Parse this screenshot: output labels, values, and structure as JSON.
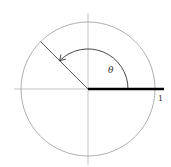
{
  "diagram": {
    "labels": {
      "theta": "θ",
      "radius_value": "1"
    },
    "geometry": {
      "center": [
        88,
        89
      ],
      "circle_radius": 67,
      "angle_degrees": 135,
      "arc_radius": 40
    },
    "colors": {
      "circle": "#9a9a9a",
      "axes": "#b5b5b5",
      "radius_line": "#555555",
      "thick_ray": "#000000",
      "arc": "#333333"
    }
  }
}
